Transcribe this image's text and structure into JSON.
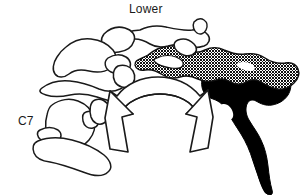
{
  "figure": {
    "name": "lower-cervical-spine-rotation-diagram",
    "background_color": "#ffffff",
    "stroke_color": "#1a1a1a",
    "labels": {
      "top": "Lower",
      "bottom_left": "C7"
    },
    "legend_shading": {
      "solid_fill_color": "#000000",
      "hatch_fill_color": "#000000",
      "hatch_background_color": "#ffffff",
      "outline_fill_color": "#ffffff"
    },
    "annotations": {
      "arrow": "double-headed-curved-arrow",
      "arrow_direction": "bidirectional-rotation"
    }
  }
}
